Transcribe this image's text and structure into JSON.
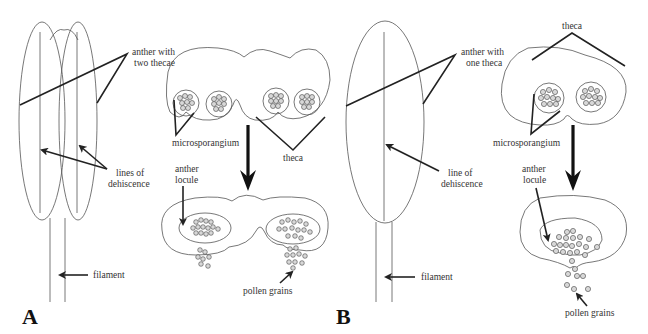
{
  "figure": {
    "panels": [
      {
        "id": "A",
        "letter": "A",
        "labels": {
          "anther": "anther with",
          "anther2": "two thecae",
          "dehiscence": "lines of",
          "dehiscence2": "dehiscence",
          "filament": "filament",
          "microsporangium": "microsporangium",
          "theca": "theca",
          "locule": "anther",
          "locule2": "locule",
          "pollen": "pollen grains"
        }
      },
      {
        "id": "B",
        "letter": "B",
        "labels": {
          "anther": "anther with",
          "anther2": "one theca",
          "dehiscence": "line of",
          "dehiscence2": "dehiscence",
          "filament": "filament",
          "microsporangium": "microsporangium",
          "theca": "theca",
          "locule": "anther",
          "locule2": "locule",
          "pollen": "pollen grains"
        }
      }
    ],
    "colors": {
      "line": "#555555",
      "leader": "#222222",
      "grain_fill": "#d8d8d8"
    }
  }
}
